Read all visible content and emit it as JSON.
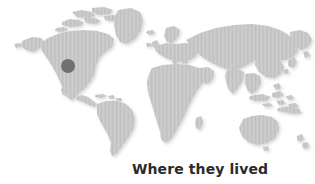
{
  "figure": {
    "type": "world-map-locator",
    "background_color": "#ffffff",
    "width": 315,
    "height": 184
  },
  "caption": {
    "text": "Where they lived",
    "color": "#2b2b2b",
    "weight": "bold"
  },
  "map": {
    "name": "world-map",
    "projection": "equirectangular-style world map",
    "land_fill_color": "#c9c9c9",
    "land_texture": "fine vertical halftone lines",
    "ocean_color": "#ffffff",
    "shadow_color": "#e6e6e6",
    "landmasses": [
      "North America",
      "Greenland",
      "South America",
      "Europe",
      "Africa",
      "Asia",
      "Australia",
      "New Zealand",
      "Japan",
      "Indonesia",
      "British Isles",
      "Madagascar"
    ]
  },
  "marker": {
    "name": "location-marker",
    "shape": "circle",
    "color": "#6f7071",
    "diameter_px": 14,
    "center_x_px": 68,
    "center_y_px": 66,
    "region": "Western United States"
  }
}
